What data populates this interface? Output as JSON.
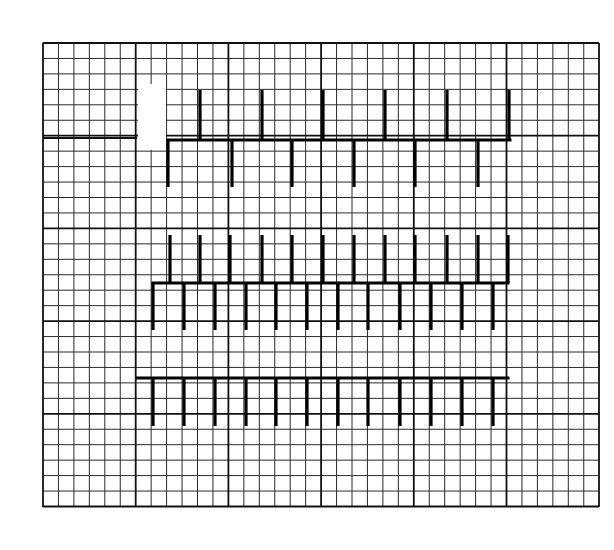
{
  "diagram": {
    "type": "grid-tick-structures",
    "background": "#ffffff",
    "line_color": "#000000",
    "grid": {
      "x0": 43,
      "y0": 43,
      "x1": 599,
      "y1": 507,
      "cell": 15.45,
      "major_every": 6,
      "cols": 36,
      "rows": 30
    },
    "erasure": {
      "x": 138,
      "y": 84,
      "w": 28,
      "h": 66
    },
    "structures": [
      {
        "name": "top-comb",
        "spine": {
          "y": 140,
          "x_start": 168,
          "x_end": 510
        },
        "left_segment": {
          "y": 138,
          "x_start": 43,
          "x_end": 137
        },
        "up_ticks": {
          "x": [
            200,
            262,
            323,
            385,
            447,
            509
          ],
          "y_top": 90
        },
        "down_ticks": {
          "x": [
            168,
            232,
            292,
            354,
            415,
            478
          ],
          "y_bottom": 187
        }
      },
      {
        "name": "middle-comb",
        "spine": {
          "y": 283,
          "x_start": 153,
          "x_end": 508
        },
        "up_ticks": {
          "x": [
            170,
            200,
            230,
            262,
            292,
            323,
            354,
            385,
            415,
            447,
            478,
            508
          ],
          "y_top": 235
        },
        "down_ticks": {
          "x": [
            153,
            184,
            215,
            246,
            276,
            307,
            338,
            368,
            400,
            431,
            462,
            493
          ],
          "y_bottom": 330
        }
      },
      {
        "name": "bottom-comb",
        "spine": {
          "y": 378,
          "x_start": 137,
          "x_end": 508
        },
        "up_ticks": {
          "x": [],
          "y_top": 378
        },
        "down_ticks": {
          "x": [
            153,
            184,
            215,
            246,
            276,
            307,
            338,
            368,
            400,
            431,
            462,
            493
          ],
          "y_bottom": 426
        }
      }
    ]
  }
}
